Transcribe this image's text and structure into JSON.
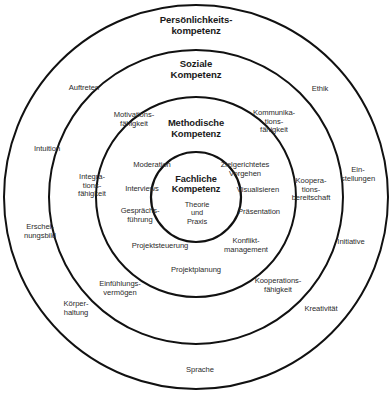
{
  "figure": {
    "background_color": "#ffffff",
    "line_color": "#111111"
  },
  "rings": {
    "outer": {
      "title": "Persönlichkeits-\nkompetenz",
      "items": [
        "Auftreten",
        "Ethik",
        "Intuition",
        "Ein-\nstellungen",
        "Erschei-\nnungsbild",
        "Initiative",
        "Körper-\nhaltung",
        "Kreativität",
        "Sprache"
      ]
    },
    "social": {
      "title": "Soziale\nKompetenz",
      "items": [
        "Motivations-\nfähigkeit",
        "Kommunika-\ntions-\nfähigkeit",
        "Integra-\ntions-\nfähigkeit",
        "Koopera-\ntions-\nbereitschaft",
        "Einfühlungs-\nvermögen",
        "Kooperations-\nfähigkeit"
      ]
    },
    "method": {
      "title": "Methodische\nKompetenz",
      "items": [
        "Moderation",
        "Zielgerichtetes\nVorgehen",
        "Interviews",
        "Visualisieren",
        "Gesprächs-\nführung",
        "Präsentation",
        "Projektsteuerung",
        "Konflikt-\nmanagement",
        "Projektplanung"
      ]
    },
    "core": {
      "title": "Fachliche\nKompetenz",
      "items": [
        "Theorie\nund\nPraxis"
      ]
    }
  },
  "geometry": {
    "center_x": 196,
    "center_y": 197,
    "radii": [
      193,
      147,
      100,
      45
    ],
    "stroke_width": 1.9
  }
}
